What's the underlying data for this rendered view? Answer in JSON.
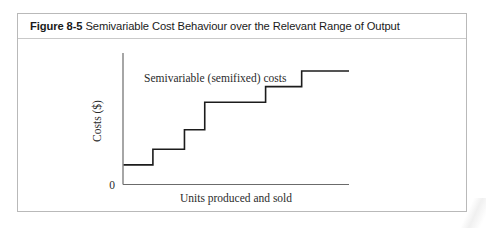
{
  "figure": {
    "number_label": "Figure 8-5",
    "title_rest": "Semivariable Cost Behaviour over the Relevant Range of Output",
    "full_title": "Figure 8-5 Semivariable Cost Behaviour over the Relevant Range of Output",
    "border_color": "#b9b9b9"
  },
  "chart_data": {
    "type": "line",
    "subtype": "step",
    "title": "Semivariable Cost Behaviour over the Relevant Range of Output",
    "xlabel": "Units produced and sold",
    "ylabel": "Costs ($)",
    "origin_label": "0",
    "grid": false,
    "legend_position": "none",
    "line_color": "#1c1c1c",
    "axis_color": "#555555",
    "xlim": [
      0,
      100
    ],
    "ylim": [
      0,
      100
    ],
    "annotations": [
      {
        "text": "Semivariable (semifixed) costs",
        "x": 18,
        "y": 78
      }
    ],
    "series": [
      {
        "name": "Semivariable (semifixed) costs",
        "step_mode": "post",
        "x": [
          0,
          13,
          13,
          27,
          27,
          36,
          36,
          63,
          63,
          79,
          79,
          97,
          100
        ],
        "y": [
          15,
          15,
          27,
          27,
          42,
          42,
          63,
          63,
          75,
          75,
          87,
          87,
          87
        ],
        "steps": [
          {
            "index": 1,
            "x_start": 0,
            "x_end": 13,
            "level": 15
          },
          {
            "index": 2,
            "x_start": 13,
            "x_end": 27,
            "level": 27
          },
          {
            "index": 3,
            "x_start": 27,
            "x_end": 36,
            "level": 42
          },
          {
            "index": 4,
            "x_start": 36,
            "x_end": 63,
            "level": 63
          },
          {
            "index": 5,
            "x_start": 63,
            "x_end": 79,
            "level": 75
          },
          {
            "index": 6,
            "x_start": 79,
            "x_end": 100,
            "level": 87
          }
        ]
      }
    ]
  }
}
